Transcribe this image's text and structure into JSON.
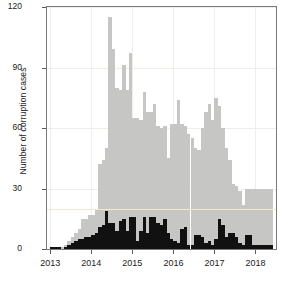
{
  "chart_data": {
    "type": "bar",
    "title": "",
    "subtitle": "",
    "xlabel": "",
    "ylabel": "Number of corruption cases",
    "ylim": [
      0,
      120
    ],
    "yticks": [
      0,
      30,
      60,
      90,
      120
    ],
    "xticks": [
      "2013",
      "2014",
      "2015",
      "2016",
      "2017",
      "2018"
    ],
    "xtick_values": [
      2013,
      2014,
      2015,
      2016,
      2017,
      2018
    ],
    "xlim": [
      2012.92,
      2018.5
    ],
    "grid": true,
    "legend": "none",
    "stacked": false,
    "annotations": [
      {
        "type": "hline",
        "value": 20,
        "color": "#efeccd",
        "label": ""
      }
    ],
    "colors": {
      "total": "#c6c6c4",
      "subset": "#111111",
      "reference_line": "#efeccd",
      "axis": "#7a7a7a",
      "grid": "#f0eee9",
      "text": "#1a1a1a",
      "background": "#ffffff"
    },
    "x": [
      2013.0,
      2013.083,
      2013.167,
      2013.25,
      2013.333,
      2013.417,
      2013.5,
      2013.583,
      2013.667,
      2013.75,
      2013.833,
      2013.917,
      2014.0,
      2014.083,
      2014.167,
      2014.25,
      2014.333,
      2014.417,
      2014.5,
      2014.583,
      2014.667,
      2014.75,
      2014.833,
      2014.917,
      2015.0,
      2015.083,
      2015.167,
      2015.25,
      2015.333,
      2015.417,
      2015.5,
      2015.583,
      2015.667,
      2015.75,
      2015.833,
      2015.917,
      2016.0,
      2016.083,
      2016.167,
      2016.25,
      2016.333,
      2016.417,
      2016.5,
      2016.583,
      2016.667,
      2016.75,
      2016.833,
      2016.917,
      2017.0,
      2017.083,
      2017.167,
      2017.25,
      2017.333,
      2017.417,
      2017.5,
      2017.583,
      2017.667,
      2017.75,
      2017.833,
      2017.917,
      2018.0,
      2018.083,
      2018.167,
      2018.25,
      2018.333
    ],
    "series": [
      {
        "name": "Total corruption cases",
        "color": "#c6c6c4",
        "values": [
          1,
          1,
          1,
          1,
          2,
          4,
          6,
          8,
          10,
          15,
          15,
          17,
          17,
          20,
          42,
          44,
          50,
          115,
          99,
          80,
          79,
          91,
          79,
          97,
          65,
          65,
          64,
          78,
          68,
          68,
          72,
          61,
          60,
          61,
          45,
          62,
          62,
          74,
          62,
          61,
          57,
          55,
          50,
          49,
          60,
          68,
          72,
          64,
          75,
          71,
          60,
          50,
          44,
          32,
          31,
          29,
          22,
          30,
          30,
          30,
          30,
          30,
          30,
          30,
          30
        ]
      },
      {
        "name": "Subset (dark)",
        "color": "#111111",
        "values": [
          1,
          1,
          1,
          0,
          1,
          2,
          3,
          4,
          5,
          5,
          6,
          6,
          7,
          8,
          11,
          12,
          19,
          13,
          13,
          9,
          14,
          15,
          9,
          16,
          16,
          4,
          9,
          16,
          8,
          16,
          16,
          13,
          12,
          15,
          8,
          5,
          4,
          3,
          10,
          11,
          2,
          2,
          7,
          7,
          6,
          3,
          4,
          2,
          5,
          15,
          12,
          6,
          8,
          8,
          6,
          3,
          2,
          7,
          7,
          2,
          2,
          2,
          2,
          2,
          2
        ]
      }
    ]
  }
}
